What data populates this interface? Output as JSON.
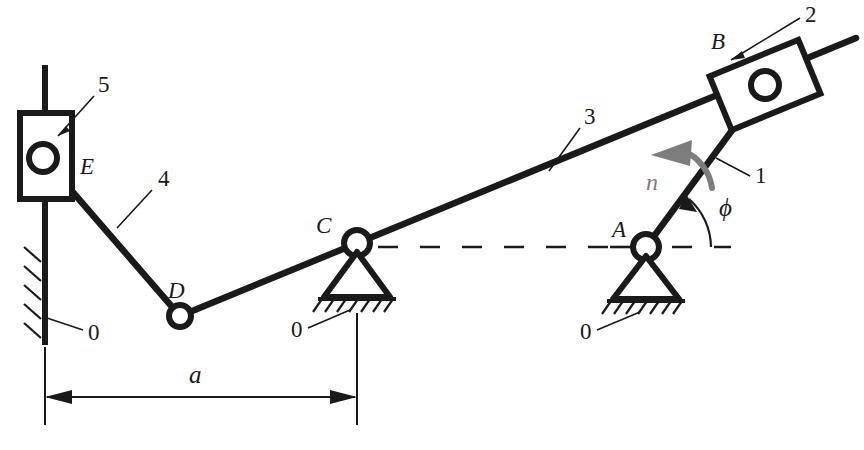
{
  "figure": {
    "background_color": "#ffffff",
    "ink_color": "#1a1a1a",
    "accent_gray": "#7d7d7d"
  },
  "labels": {
    "link_1": "1",
    "link_2": "2",
    "link_3": "3",
    "link_4": "4",
    "link_5": "5",
    "ground_left": "0",
    "ground_c": "0",
    "ground_a": "0",
    "joint_a": "A",
    "joint_b": "B",
    "joint_c": "C",
    "joint_d": "D",
    "joint_e": "E",
    "angle_phi": "ϕ",
    "speed_n": "n",
    "dimension_a": "a"
  },
  "geometry": {
    "joint_a": {
      "x": 646,
      "y": 247
    },
    "joint_b": {
      "x": 765,
      "y": 85
    },
    "joint_c": {
      "x": 357,
      "y": 243
    },
    "joint_d": {
      "x": 180,
      "y": 316
    },
    "joint_e": {
      "x": 43,
      "y": 158
    },
    "guide_x": 45,
    "guide_top_y": 65,
    "guide_bottom_y": 345,
    "baseline_y": 247,
    "dimension_y": 397,
    "dimension_from_x": 45,
    "dimension_to_x": 357
  },
  "annotations": {
    "phi_description": "crank angle from horizontal reference",
    "n_description": "input rotation speed direction"
  }
}
